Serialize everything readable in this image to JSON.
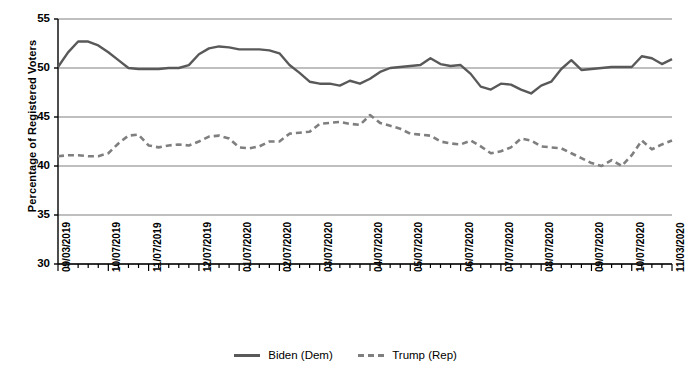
{
  "chart_data": {
    "type": "line",
    "title": "",
    "xlabel": "",
    "ylabel": "Percentage of Registered Voters",
    "ylim": [
      30,
      55
    ],
    "yticks": [
      30,
      35,
      40,
      45,
      50,
      55
    ],
    "grid": true,
    "legend_position": "bottom",
    "x_tick_labels": [
      "09/03/2019",
      "10/07/2019",
      "11/07/2019",
      "12/07/2019",
      "01/07/2020",
      "02/07/2020",
      "03/07/2020",
      "04/07/2020",
      "05/07/2020",
      "06/07/2020",
      "07/07/2020",
      "08/07/2020",
      "09/07/2020",
      "10/07/2020",
      "11/03/2020"
    ],
    "x_tick_indices": [
      0,
      5,
      9,
      14,
      18,
      22,
      26,
      31,
      35,
      40,
      44,
      48,
      53,
      57,
      61
    ],
    "n_points": 62,
    "series": [
      {
        "name": "Biden (Dem)",
        "style": "solid",
        "color": "#595959",
        "values": [
          50.1,
          51.6,
          52.7,
          52.7,
          52.3,
          51.6,
          50.8,
          50.0,
          49.9,
          49.9,
          49.9,
          50.0,
          50.0,
          50.3,
          51.4,
          52.0,
          52.2,
          52.1,
          51.9,
          51.9,
          51.9,
          51.8,
          51.5,
          50.3,
          49.5,
          48.6,
          48.4,
          48.4,
          48.2,
          48.7,
          48.4,
          48.9,
          49.6,
          50.0,
          50.1,
          50.2,
          50.3,
          51.0,
          50.4,
          50.2,
          50.3,
          49.4,
          48.1,
          47.8,
          48.4,
          48.3,
          47.8,
          47.4,
          48.2,
          48.6,
          49.9,
          50.8,
          49.8,
          49.9,
          50.0,
          50.1,
          50.1,
          50.1,
          51.2,
          51.0,
          50.4,
          50.9
        ]
      },
      {
        "name": "Trump (Rep)",
        "style": "dashed",
        "color": "#7f7f7f",
        "values": [
          41.0,
          41.1,
          41.1,
          41.0,
          41.0,
          41.3,
          42.3,
          43.1,
          43.2,
          42.1,
          41.9,
          42.1,
          42.2,
          42.1,
          42.5,
          43.0,
          43.1,
          42.8,
          41.9,
          41.8,
          42.0,
          42.5,
          42.5,
          43.3,
          43.4,
          43.5,
          44.3,
          44.4,
          44.5,
          44.3,
          44.2,
          45.2,
          44.4,
          44.1,
          43.8,
          43.3,
          43.2,
          43.1,
          42.5,
          42.3,
          42.2,
          42.6,
          42.0,
          41.3,
          41.5,
          41.9,
          42.8,
          42.6,
          42.0,
          41.9,
          41.8,
          41.3,
          40.8,
          40.3,
          40.0,
          40.6,
          40.0,
          41.1,
          42.6,
          41.7,
          42.2,
          42.6
        ]
      }
    ]
  },
  "legend": {
    "items": [
      {
        "label": "Biden (Dem)"
      },
      {
        "label": "Trump (Rep)"
      }
    ]
  }
}
